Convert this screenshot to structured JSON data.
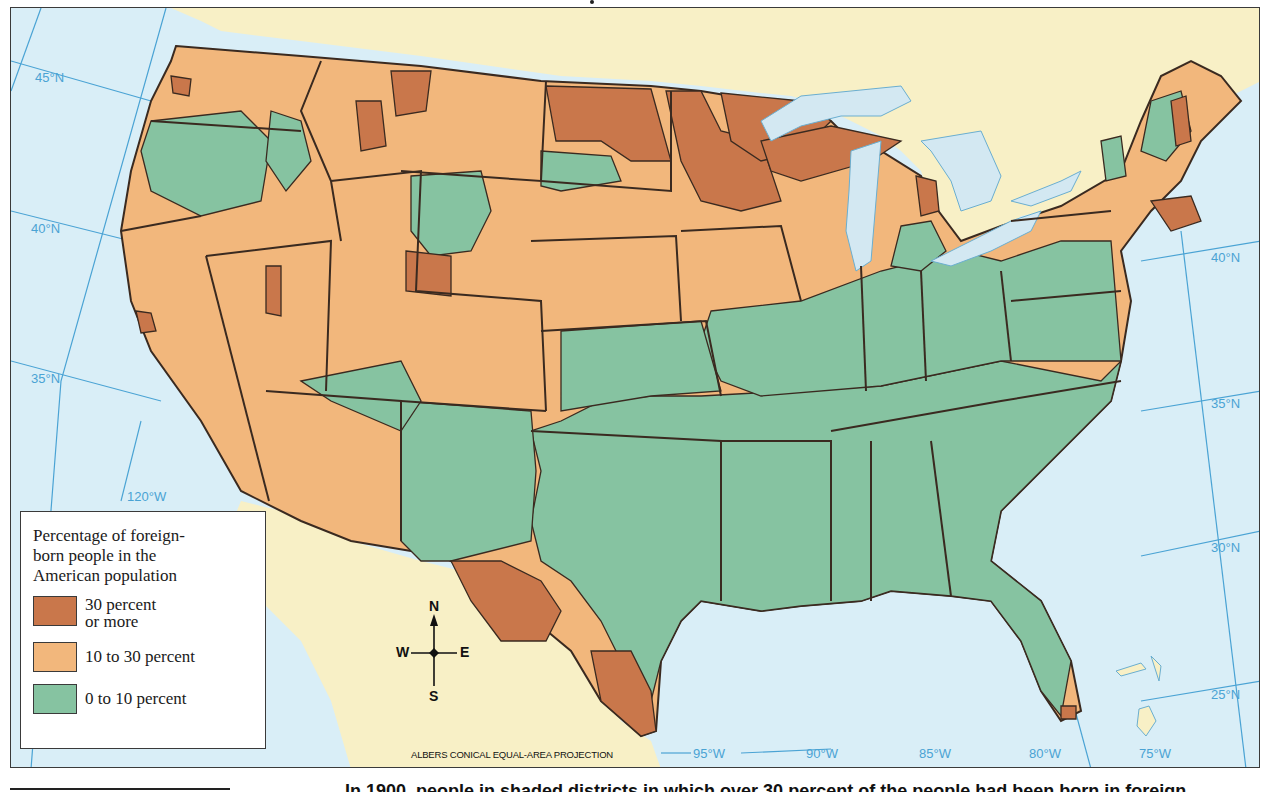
{
  "map": {
    "projection_label": "ALBERS CONICAL EQUAL-AREA PROJECTION",
    "colors": {
      "ocean": "#d9eef7",
      "land_foreign": "#f8f0c6",
      "high": "#c9774b",
      "mid": "#f2b77c",
      "low": "#86c3a1",
      "border": "#3a2a20",
      "grid": "#4aa3d4",
      "lake": "#d3e8f2"
    },
    "latitude_labels": [
      {
        "text": "45°N",
        "side": "west"
      },
      {
        "text": "40°N",
        "side": "west"
      },
      {
        "text": "35°N",
        "side": "west"
      },
      {
        "text": "40°N",
        "side": "east"
      },
      {
        "text": "35°N",
        "side": "east"
      },
      {
        "text": "30°N",
        "side": "east"
      },
      {
        "text": "25°N",
        "side": "east"
      }
    ],
    "longitude_labels": [
      "120°W",
      "95°W",
      "90°W",
      "85°W",
      "80°W",
      "75°W"
    ]
  },
  "legend": {
    "title_lines": [
      "Percentage of foreign-",
      "born people in the",
      "American population"
    ],
    "items": [
      {
        "lines": [
          "30 percent",
          "or more"
        ],
        "color": "#c9774b"
      },
      {
        "lines": [
          "10 to 30 percent"
        ],
        "color": "#f2b77c"
      },
      {
        "lines": [
          "0 to 10 percent"
        ],
        "color": "#86c3a1"
      }
    ]
  },
  "compass": {
    "n": "N",
    "s": "S",
    "e": "E",
    "w": "W"
  },
  "caption": {
    "text": "In 1900, people in shaded districts in which over 30 percent of the people had been born in foreign"
  }
}
